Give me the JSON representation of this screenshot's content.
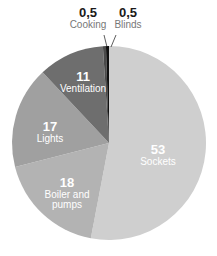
{
  "chart_data": {
    "type": "pie",
    "title": "",
    "start_angle": "12 o'clock, clockwise",
    "categories": [
      "Sockets",
      "Boiler and pumps",
      "Lights",
      "Ventilation",
      "Cooking",
      "Blinds"
    ],
    "values": [
      53,
      18,
      17,
      11,
      0.5,
      0.5
    ],
    "value_labels": [
      "53",
      "18",
      "17",
      "11",
      "0,5",
      "0,5"
    ],
    "colors": [
      "#cfcfcf",
      "#b3b3b3",
      "#a0a0a0",
      "#6e6e6e",
      "#4a4a4a",
      "#111111"
    ]
  },
  "labels": {
    "sockets": {
      "value": "53",
      "name": "Sockets"
    },
    "boiler": {
      "value": "18",
      "name": "Boiler and pumps"
    },
    "lights": {
      "value": "17",
      "name": "Lights"
    },
    "ventilation": {
      "value": "11",
      "name": "Ventilation"
    },
    "cooking": {
      "value": "0,5",
      "name": "Cooking"
    },
    "blinds": {
      "value": "0,5",
      "name": "Blinds"
    }
  }
}
